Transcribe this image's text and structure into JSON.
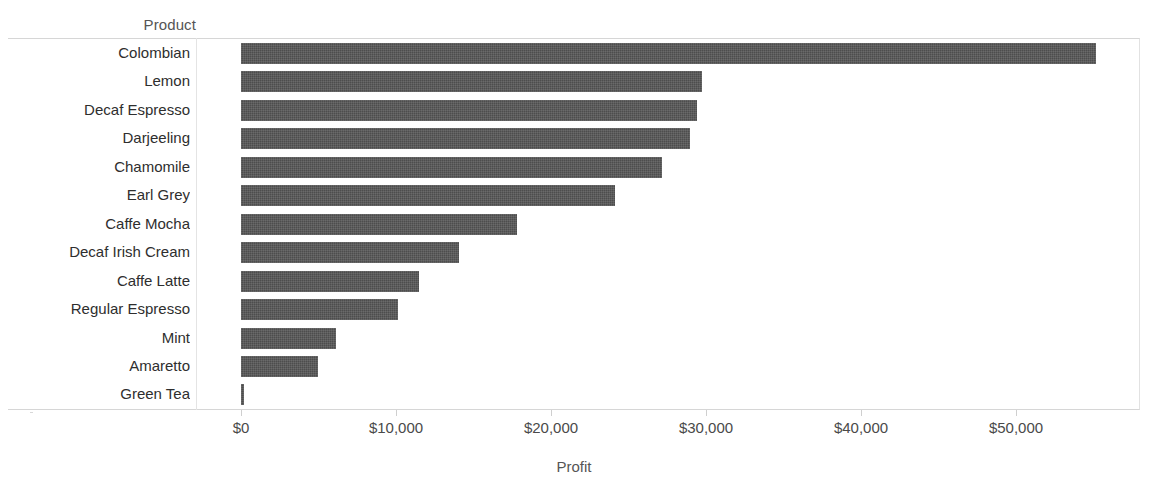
{
  "field_caption": "Product",
  "axis": {
    "title": "Profit",
    "tick_labels": [
      "$0",
      "$10,000",
      "$20,000",
      "$30,000",
      "$40,000",
      "$50,000"
    ],
    "tick_values": [
      0,
      10000,
      20000,
      30000,
      40000,
      50000
    ]
  },
  "style": {
    "bar_color": "#4d4d4d",
    "background": "#ffffff",
    "gridline_color": "#d6d6d6",
    "text_color": "#2e2e2e"
  },
  "chart_data": {
    "type": "bar",
    "orientation": "horizontal",
    "title": "",
    "xlabel": "Profit",
    "ylabel": "Product",
    "xlim": [
      0,
      56500
    ],
    "grid": false,
    "legend": "none",
    "sorted": "descending",
    "categories": [
      "Colombian",
      "Lemon",
      "Decaf Espresso",
      "Darjeeling",
      "Chamomile",
      "Earl Grey",
      "Caffe Mocha",
      "Decaf Irish Cream",
      "Caffe Latte",
      "Regular Espresso",
      "Mint",
      "Amaretto",
      "Green Tea"
    ],
    "values": [
      55160,
      29740,
      29420,
      28980,
      27160,
      24130,
      17800,
      14060,
      11480,
      10130,
      6130,
      4970,
      190
    ]
  }
}
